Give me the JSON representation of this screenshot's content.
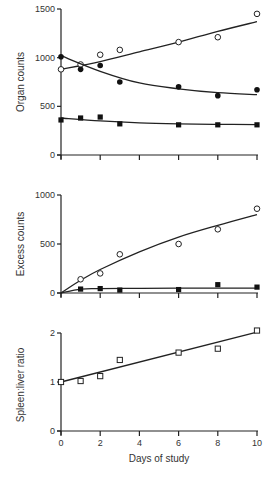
{
  "chart_data": [
    {
      "type": "scatter",
      "title": "",
      "xlabel": "",
      "ylabel": "Organ counts",
      "xlim": [
        0,
        10
      ],
      "ylim": [
        0,
        1500
      ],
      "yticks": [
        0,
        500,
        1000,
        1500
      ],
      "xticks": [
        0,
        2,
        4,
        6,
        8,
        10
      ],
      "grid": false,
      "x": [
        0,
        1,
        2,
        3,
        6,
        8,
        10
      ],
      "series": [
        {
          "name": "open circles",
          "marker": "open-circle",
          "values": [
            880,
            930,
            1030,
            1080,
            1160,
            1210,
            1450
          ],
          "fit": [
            [
              0,
              880
            ],
            [
              2,
              960
            ],
            [
              4,
              1060
            ],
            [
              6,
              1160
            ],
            [
              8,
              1270
            ],
            [
              10,
              1370
            ]
          ]
        },
        {
          "name": "filled circles",
          "marker": "filled-circle",
          "values": [
            1010,
            880,
            920,
            750,
            700,
            610,
            670
          ],
          "fit": [
            [
              0,
              1020
            ],
            [
              2,
              860
            ],
            [
              4,
              740
            ],
            [
              6,
              680
            ],
            [
              8,
              640
            ],
            [
              10,
              620
            ]
          ]
        },
        {
          "name": "filled squares",
          "marker": "filled-square",
          "values": [
            360,
            380,
            390,
            320,
            310,
            310,
            310
          ],
          "fit": [
            [
              0,
              380
            ],
            [
              2,
              350
            ],
            [
              4,
              330
            ],
            [
              6,
              320
            ],
            [
              8,
              315
            ],
            [
              10,
              312
            ]
          ]
        }
      ]
    },
    {
      "type": "scatter",
      "title": "",
      "xlabel": "",
      "ylabel": "Excess counts",
      "xlim": [
        0,
        10
      ],
      "ylim": [
        0,
        1000
      ],
      "yticks": [
        0,
        500,
        1000
      ],
      "xticks": [
        0,
        2,
        4,
        6,
        8,
        10
      ],
      "grid": false,
      "x": [
        1,
        2,
        3,
        6,
        8,
        10
      ],
      "series": [
        {
          "name": "open circles",
          "marker": "open-circle",
          "values": [
            140,
            200,
            395,
            500,
            650,
            860
          ],
          "fit": [
            [
              0,
              0
            ],
            [
              1,
              130
            ],
            [
              2,
              240
            ],
            [
              4,
              420
            ],
            [
              6,
              570
            ],
            [
              8,
              690
            ],
            [
              10,
              800
            ]
          ]
        },
        {
          "name": "filled squares",
          "marker": "filled-square",
          "values": [
            40,
            45,
            30,
            35,
            85,
            60
          ],
          "fit": [
            [
              0,
              0
            ],
            [
              1,
              40
            ],
            [
              2,
              45
            ],
            [
              4,
              48
            ],
            [
              6,
              50
            ],
            [
              8,
              50
            ],
            [
              10,
              50
            ]
          ]
        }
      ]
    },
    {
      "type": "scatter",
      "title": "",
      "xlabel": "Days of study",
      "ylabel": "Spleen:liver ratio",
      "xlim": [
        0,
        10
      ],
      "ylim": [
        0,
        2
      ],
      "yticks": [
        0,
        1,
        2
      ],
      "xticks": [
        0,
        2,
        4,
        6,
        8,
        10
      ],
      "grid": false,
      "x": [
        0,
        1,
        2,
        3,
        6,
        8,
        10
      ],
      "series": [
        {
          "name": "open squares",
          "marker": "open-square",
          "values": [
            1.0,
            1.02,
            1.12,
            1.45,
            1.6,
            1.68,
            2.05
          ],
          "fit": [
            [
              0,
              1.0
            ],
            [
              10,
              2.02
            ]
          ]
        }
      ]
    }
  ],
  "labels": {
    "top_ylabel": "Organ counts",
    "mid_ylabel": "Excess counts",
    "bottom_ylabel": "Spleen:liver ratio",
    "xlabel": "Days of study",
    "top_yticks": [
      "0",
      "500",
      "1000",
      "1500"
    ],
    "mid_yticks": [
      "0",
      "500",
      "1000"
    ],
    "bottom_yticks": [
      "0",
      "1",
      "2"
    ],
    "xticks": [
      "0",
      "2",
      "4",
      "6",
      "8",
      "10"
    ]
  }
}
